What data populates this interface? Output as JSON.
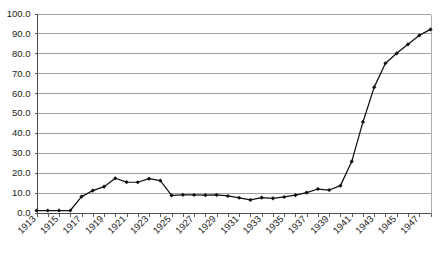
{
  "chart_data": {
    "type": "line",
    "title": "",
    "subtitle": "",
    "xlabel": "",
    "ylabel": "",
    "grid": true,
    "legend": false,
    "legend_position": "none",
    "xlim": [
      1913,
      1948
    ],
    "ylim": [
      0.0,
      100.0
    ],
    "ytick_labels": [
      "0.0",
      "10.0",
      "20.0",
      "30.0",
      "40.0",
      "50.0",
      "60.0",
      "70.0",
      "80.0",
      "90.0",
      "100.0"
    ],
    "ytick_values": [
      0.0,
      10.0,
      20.0,
      30.0,
      40.0,
      50.0,
      60.0,
      70.0,
      80.0,
      90.0,
      100.0
    ],
    "xtick_labels": [
      "1913",
      "1915",
      "1917",
      "1919",
      "1921",
      "1923",
      "1925",
      "1927",
      "1929",
      "1931",
      "1933",
      "1935",
      "1937",
      "1939",
      "1941",
      "1943",
      "1945",
      "1947"
    ],
    "xtick_values": [
      1913,
      1915,
      1917,
      1919,
      1921,
      1923,
      1925,
      1927,
      1929,
      1931,
      1933,
      1935,
      1937,
      1939,
      1941,
      1943,
      1945,
      1947
    ],
    "x": [
      1913,
      1914,
      1915,
      1916,
      1917,
      1918,
      1919,
      1920,
      1921,
      1922,
      1923,
      1924,
      1925,
      1926,
      1927,
      1928,
      1929,
      1930,
      1931,
      1932,
      1933,
      1934,
      1935,
      1936,
      1937,
      1938,
      1939,
      1940,
      1941,
      1942,
      1943,
      1944,
      1945,
      1946,
      1947,
      1948
    ],
    "values": [
      1.0,
      1.0,
      1.0,
      1.0,
      8.0,
      11.0,
      13.0,
      17.2,
      15.3,
      15.2,
      17.0,
      16.0,
      8.6,
      8.9,
      8.8,
      8.7,
      8.8,
      8.3,
      7.4,
      6.3,
      7.5,
      7.1,
      7.8,
      8.7,
      10.0,
      11.8,
      11.3,
      13.5,
      25.6,
      45.5,
      63.0,
      75.0,
      80.0,
      84.5,
      89.0,
      92.0
    ],
    "series": [
      {
        "name": "series-1",
        "color": "#111111",
        "marker": "filled-diamond",
        "values": [
          1.0,
          1.0,
          1.0,
          1.0,
          8.0,
          11.0,
          13.0,
          17.2,
          15.3,
          15.2,
          17.0,
          16.0,
          8.6,
          8.9,
          8.8,
          8.7,
          8.8,
          8.3,
          7.4,
          6.3,
          7.5,
          7.1,
          7.8,
          8.7,
          10.0,
          11.8,
          11.3,
          13.5,
          25.6,
          45.5,
          63.0,
          75.0,
          80.0,
          84.5,
          89.0,
          92.0
        ]
      }
    ],
    "colors": {
      "series": "#111111",
      "grid": "#8c8c8c",
      "axis": "#4d4d4d",
      "text": "#1a1a1a",
      "background": "#ffffff"
    }
  }
}
